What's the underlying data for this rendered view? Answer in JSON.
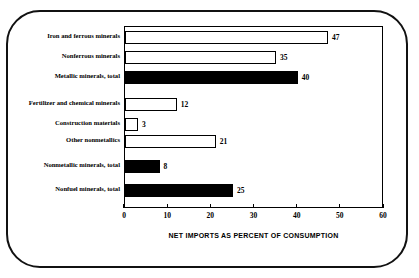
{
  "chart_data": {
    "type": "bar",
    "orientation": "horizontal",
    "title": "",
    "xlabel": "NET IMPORTS AS PERCENT OF CONSUMPTION",
    "ylabel": "",
    "xlim": [
      0,
      60
    ],
    "xticks": [
      0,
      10,
      20,
      30,
      40,
      50,
      60
    ],
    "xtick_labels": [
      "0",
      "10",
      "20",
      "30",
      "40",
      "50",
      "60"
    ],
    "grid": false,
    "legend": null,
    "categories": [
      "Iron and ferrous minerals",
      "Nonferrous minerals",
      "Metallic minerals, total",
      "Fertilizer and chemical minerals",
      "Construction materials",
      "Other nonmetallics",
      "Nonmetallic minerals, total",
      "Nonfuel minerals, total"
    ],
    "values": [
      47,
      35,
      40,
      12,
      3,
      21,
      8,
      25
    ],
    "value_labels": [
      "47",
      "35",
      "40",
      "12",
      "3",
      "21",
      "8",
      "25"
    ],
    "bar_styles": [
      "hollow",
      "hollow",
      "solid",
      "hollow",
      "hollow",
      "hollow",
      "solid",
      "solid"
    ],
    "colors": {
      "hollow_fill": "#ffffff",
      "hollow_stroke": "#000000",
      "solid_fill": "#000000",
      "axis": "#000000",
      "background": "#ffffff"
    }
  }
}
